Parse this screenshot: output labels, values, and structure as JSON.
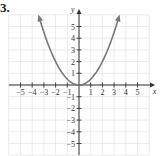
{
  "problem": {
    "number": "3."
  },
  "chart_data": {
    "type": "line",
    "title": "",
    "function": "y = x^2 / 2",
    "xlabel": "x",
    "ylabel": "y",
    "xlim": [
      -6,
      6
    ],
    "ylim": [
      -6,
      6
    ],
    "grid": true,
    "x_ticks": [
      -5,
      -4,
      -3,
      -2,
      -1,
      1,
      2,
      3,
      4,
      5
    ],
    "y_ticks": [
      -5,
      -4,
      -3,
      -2,
      -1,
      1,
      2,
      3,
      4,
      5
    ],
    "x_tick_labels": [
      "−5",
      "−4",
      "−3",
      "−2",
      "−1",
      "1",
      "2",
      "3",
      "4",
      "5"
    ],
    "y_tick_labels": [
      "−5",
      "−4",
      "−3",
      "−2",
      "−1",
      "1",
      "2",
      "3",
      "4",
      "5"
    ],
    "series": [
      {
        "name": "parabola",
        "x": [
          -3.5,
          -3,
          -2,
          -1,
          0,
          1,
          2,
          3,
          3.5
        ],
        "y": [
          6.125,
          4.5,
          2,
          0.5,
          0,
          0.5,
          2,
          4.5,
          6.125
        ],
        "color": "#777777",
        "arrows": "both ends"
      }
    ]
  },
  "colors": {
    "grid": "#dddddd",
    "axis": "#333333",
    "curve": "#7a7a7a"
  }
}
